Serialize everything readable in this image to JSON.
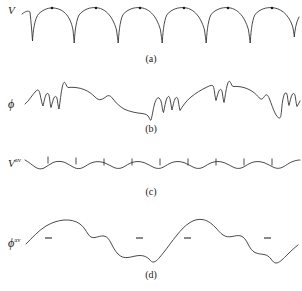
{
  "figure": {
    "background_color": "#ffffff",
    "stroke_color": "#2b2b2b",
    "width": 302,
    "height": 291,
    "panel_count": 4
  },
  "panels": [
    {
      "id": "a",
      "caption": "(a)",
      "axis_label": "V",
      "axis_label_superscript": "",
      "description": "periodic cusped potential, arches with sharp downward cusps and dots above each arch peak",
      "curve_type": "cusped-periodic",
      "period": 44,
      "arch_count": 7,
      "markers": {
        "type": "dot",
        "count": 6,
        "x": [
          52,
          96,
          140,
          184,
          228,
          272
        ],
        "y": [
          8,
          8,
          8,
          8,
          8,
          8
        ],
        "radius": 1.3
      },
      "cusp_x": [
        30,
        74,
        118,
        162,
        206,
        250,
        294
      ],
      "baseline_y": 10,
      "cusp_depth_y": 40
    },
    {
      "id": "b",
      "caption": "(b)",
      "axis_label": "ϕ",
      "axis_label_superscript": "",
      "description": "rough fluctuating phase curve with sharp spikes and a downward drift",
      "curve_type": "rough-fluctuating"
    },
    {
      "id": "c",
      "caption": "(c)",
      "axis_label": "V",
      "axis_label_superscript": "av",
      "description": "smoothed, flattened potential with small vertical tick marks at regular intervals",
      "curve_type": "flattened-undulating",
      "ticks": {
        "count": 9,
        "x": [
          48,
          76,
          104,
          132,
          160,
          188,
          216,
          244,
          272
        ],
        "length": 6
      }
    },
    {
      "id": "d",
      "caption": "(d)",
      "axis_label": "ϕ",
      "axis_label_superscript": "av",
      "description": "smooth slowly varying phase curve with short horizontal dash markers",
      "curve_type": "smooth-wave",
      "markers": {
        "type": "dash",
        "count": 4,
        "x": [
          48,
          140,
          188,
          268
        ],
        "length": 7
      }
    }
  ]
}
